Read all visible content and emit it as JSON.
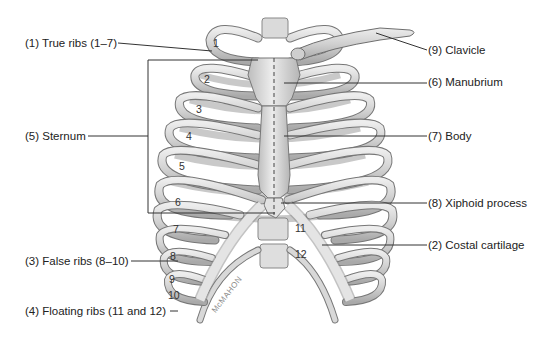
{
  "diagram": {
    "colors": {
      "background": "#ffffff",
      "bone": "#d9d9d9",
      "bone_shade": "#a8a8a8",
      "bone_outline": "#6e6e6e",
      "cartilage": "#efefef",
      "leader_line": "#333333",
      "text": "#222222"
    },
    "labels": {
      "true_ribs": "(1) True ribs (1–7)",
      "sternum": "(5) Sternum",
      "false_ribs": "(3) False ribs (8–10)",
      "floating_ribs": "(4) Floating ribs (11 and 12)",
      "clavicle": "(9) Clavicle",
      "manubrium": "(6) Manubrium",
      "body": "(7) Body",
      "xiphoid": "(8) Xiphoid process",
      "costal_cartilage": "(2) Costal cartilage"
    },
    "rib_numbers": [
      "1",
      "2",
      "3",
      "4",
      "5",
      "6",
      "7",
      "8",
      "9",
      "10",
      "11",
      "12"
    ],
    "artist_signature": "McMAHON"
  }
}
